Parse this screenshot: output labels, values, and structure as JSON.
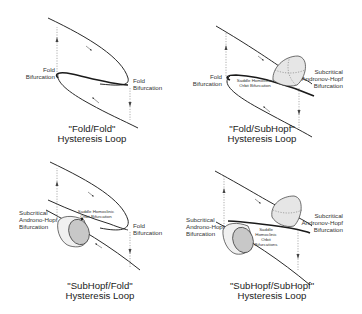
{
  "panels": [
    {
      "id": "fold-fold",
      "title_line1": "\"Fold/Fold\"",
      "title_line2": "Hysteresis Loop",
      "labels": {
        "left_line1": "Fold",
        "left_line2": "Bifurcation",
        "right_line1": "Fold",
        "right_line2": "Bifurcation"
      }
    },
    {
      "id": "fold-subhopf",
      "title_line1": "\"Fold/SubHopf\"",
      "title_line2": "Hysteresis Loop",
      "labels": {
        "left_line1": "Fold",
        "left_line2": "Bifurcation",
        "middle_line1": "Saddle Homoclinic",
        "middle_line2": "Orbit Bifurcation",
        "right_line1": "Subcritical",
        "right_line2": "Andronov-Hopf",
        "right_line3": "Bifurcation"
      }
    },
    {
      "id": "subhopf-fold",
      "title_line1": "\"SubHopf/Fold\"",
      "title_line2": "Hysteresis Loop",
      "labels": {
        "left_line1": "Subcritical",
        "left_line2": "Androno-Hopf",
        "left_line3": "Bifurcation",
        "middle_line1": "Saddle Homoclinic",
        "middle_line2": "Orbit Bifurcation",
        "right_line1": "Fold",
        "right_line2": "Bifurcation"
      }
    },
    {
      "id": "subhopf-subhopf",
      "title_line1": "\"SubHopf/SubHopf\"",
      "title_line2": "Hysteresis Loop",
      "labels": {
        "left_line1": "Subcritical",
        "left_line2": "Androno-Hopf",
        "left_line3": "Bifurcation",
        "middle_line1": "Saddle",
        "middle_line2": "Homoclinic",
        "middle_line3": "Orbit",
        "middle_line4": "Bifurcations",
        "right_line1": "Subcritical",
        "right_line2": "Andronov-Hopf",
        "right_line3": "Bifurcation"
      }
    }
  ]
}
